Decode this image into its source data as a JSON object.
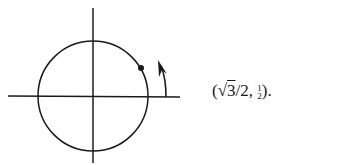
{
  "diagram": {
    "type": "unit circle with point at angle",
    "axes": {
      "horizontal": true,
      "vertical": true
    },
    "circle": {
      "center": [
        93,
        96
      ],
      "radius": 55
    },
    "point": {
      "angle_deg": 30,
      "label": "(√3/2, 1/2)"
    },
    "arrow": {
      "direction": "counterclockwise"
    },
    "color": "#1a1a1a"
  },
  "coordinate_label": {
    "open": "(√",
    "radicand": "3",
    "after_sqrt": "/2, ",
    "frac_num": "1",
    "frac_den": "2",
    "close": ")."
  }
}
